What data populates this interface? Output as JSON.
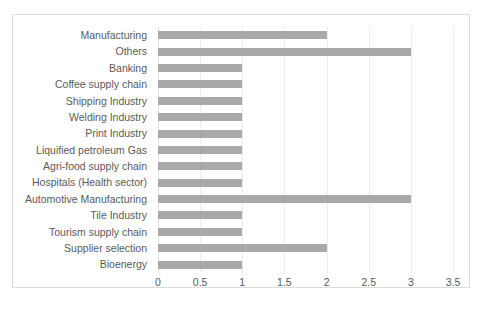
{
  "chart_data": {
    "type": "bar",
    "orientation": "horizontal",
    "title": "",
    "xlabel": "",
    "ylabel": "",
    "xlim": [
      0,
      3.5
    ],
    "xticks": [
      "0",
      "0.5",
      "1",
      "1.5",
      "2",
      "2.5",
      "3",
      "3.5"
    ],
    "xtick_values": [
      0,
      0.5,
      1,
      1.5,
      2,
      2.5,
      3,
      3.5
    ],
    "grid": true,
    "legend": false,
    "categories": [
      "Manufacturing",
      "Others",
      "Banking",
      "Coffee supply chain",
      "Shipping Industry",
      "Welding Industry",
      "Print Industry",
      "Liquified petroleum Gas",
      "Agri-food supply chain",
      "Hospitals (Health sector)",
      "Automotive Manufacturing",
      "Tile Industry",
      "Tourism supply chain",
      "Supplier selection",
      "Bioenergy"
    ],
    "values": [
      2,
      3,
      1,
      1,
      1,
      1,
      1,
      1,
      1,
      1,
      3,
      1,
      1,
      2,
      1
    ],
    "colors": {
      "bar": "#a9a9a9",
      "gridline": "#ececec",
      "border": "#dcdcdc",
      "text": "#5a5a5a",
      "background": "#ffffff"
    }
  }
}
